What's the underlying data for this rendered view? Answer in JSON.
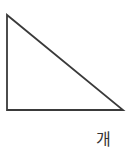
{
  "diagram": {
    "shape": "right-triangle",
    "vertices": [
      [
        7,
        15
      ],
      [
        7,
        110
      ],
      [
        123,
        110
      ]
    ],
    "stroke_color": "#3a3a3a",
    "fill_color": "#ffffff",
    "label": "개"
  }
}
